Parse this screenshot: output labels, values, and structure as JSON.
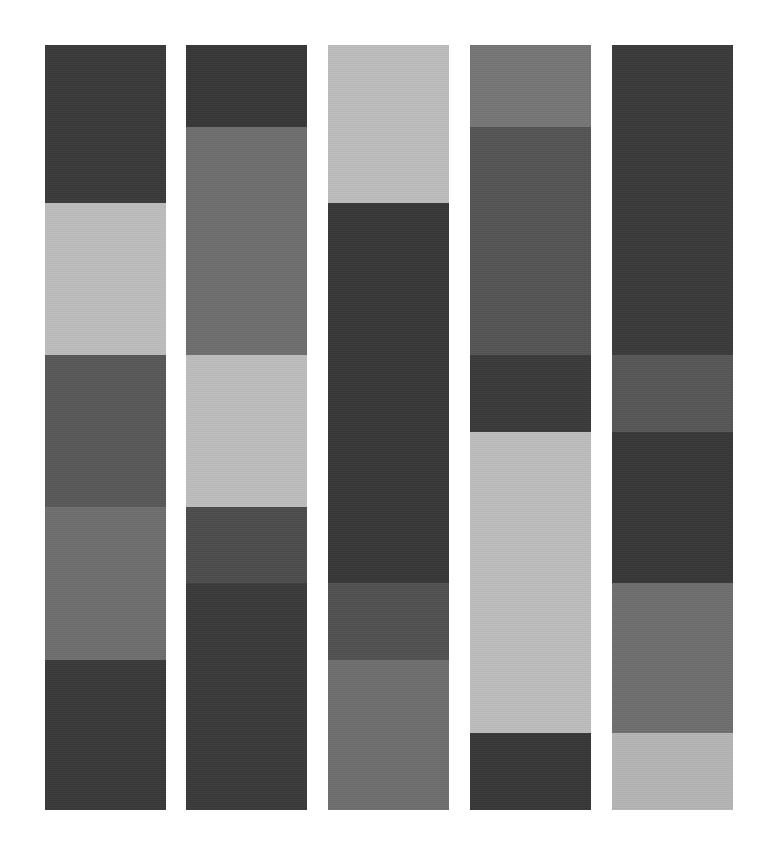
{
  "page": {
    "background_color": "#ffffff",
    "width": 774,
    "height": 862
  },
  "chart_data": {
    "type": "bar",
    "title": "",
    "subtitle": "",
    "xlabel": "",
    "ylabel": "",
    "grid": false,
    "legend_position": "none",
    "orientation": "vertical",
    "stacked": true,
    "axis_visible": false,
    "tick_labels_visible": false,
    "categories": [
      "Column 1",
      "Column 2",
      "Column 3",
      "Column 4",
      "Column 5"
    ],
    "ylim": [
      0,
      765
    ],
    "palette": {
      "darkest": "#333333",
      "dark": "#3f3f3f",
      "dark_gray": "#4a4a4a",
      "mid_dark_gray": "#565656",
      "mid_gray": "#6e6e6e",
      "gray": "#7a7a7a",
      "light_gray": "#b8b8b8",
      "lighter_gray": "#bfbfbf"
    },
    "columns": [
      {
        "name": "Column 1",
        "x": 45,
        "width": 121,
        "segments": [
          {
            "label": "C1-S1",
            "color": "#3a3a3a",
            "start": 45,
            "end": 203,
            "height": 158
          },
          {
            "label": "C1-S2",
            "color": "#bcbcbc",
            "start": 203,
            "end": 355,
            "height": 152
          },
          {
            "label": "C1-S3",
            "color": "#585858",
            "start": 355,
            "end": 507,
            "height": 152
          },
          {
            "label": "C1-S4",
            "color": "#6e6e6e",
            "start": 507,
            "end": 660,
            "height": 153
          },
          {
            "label": "C1-S5",
            "color": "#393939",
            "start": 660,
            "end": 810,
            "height": 150
          }
        ]
      },
      {
        "name": "Column 2",
        "x": 186,
        "width": 121,
        "segments": [
          {
            "label": "C2-S1",
            "color": "#373737",
            "start": 45,
            "end": 127,
            "height": 82
          },
          {
            "label": "C2-S2",
            "color": "#6e6e6e",
            "start": 127,
            "end": 355,
            "height": 228
          },
          {
            "label": "C2-S3",
            "color": "#bcbcbc",
            "start": 355,
            "end": 507,
            "height": 152
          },
          {
            "label": "C2-S4",
            "color": "#4c4c4c",
            "start": 507,
            "end": 583,
            "height": 76
          },
          {
            "label": "C2-S5",
            "color": "#3a3a3a",
            "start": 583,
            "end": 810,
            "height": 227
          }
        ]
      },
      {
        "name": "Column 3",
        "x": 328,
        "width": 121,
        "segments": [
          {
            "label": "C3-S1",
            "color": "#bcbcbc",
            "start": 45,
            "end": 203,
            "height": 158
          },
          {
            "label": "C3-S2",
            "color": "#373737",
            "start": 203,
            "end": 583,
            "height": 380
          },
          {
            "label": "C3-S3",
            "color": "#505050",
            "start": 583,
            "end": 660,
            "height": 77
          },
          {
            "label": "C3-S4",
            "color": "#6e6e6e",
            "start": 660,
            "end": 810,
            "height": 150
          }
        ]
      },
      {
        "name": "Column 4",
        "x": 470,
        "width": 121,
        "segments": [
          {
            "label": "C4-S1",
            "color": "#767676",
            "start": 45,
            "end": 127,
            "height": 82
          },
          {
            "label": "C4-S2",
            "color": "#545454",
            "start": 127,
            "end": 355,
            "height": 228
          },
          {
            "label": "C4-S3",
            "color": "#3a3a3a",
            "start": 355,
            "end": 432,
            "height": 77
          },
          {
            "label": "C4-S4",
            "color": "#bcbcbc",
            "start": 432,
            "end": 733,
            "height": 301
          },
          {
            "label": "C4-S5",
            "color": "#373737",
            "start": 733,
            "end": 810,
            "height": 77
          }
        ]
      },
      {
        "name": "Column 5",
        "x": 612,
        "width": 121,
        "segments": [
          {
            "label": "C5-S1",
            "color": "#3a3a3a",
            "start": 45,
            "end": 355,
            "height": 310
          },
          {
            "label": "C5-S2",
            "color": "#565656",
            "start": 355,
            "end": 432,
            "height": 77
          },
          {
            "label": "C5-S3",
            "color": "#373737",
            "start": 432,
            "end": 583,
            "height": 151
          },
          {
            "label": "C5-S4",
            "color": "#6e6e6e",
            "start": 583,
            "end": 733,
            "height": 150
          },
          {
            "label": "C5-S5",
            "color": "#b4b4b4",
            "start": 733,
            "end": 810,
            "height": 77
          }
        ]
      }
    ]
  }
}
